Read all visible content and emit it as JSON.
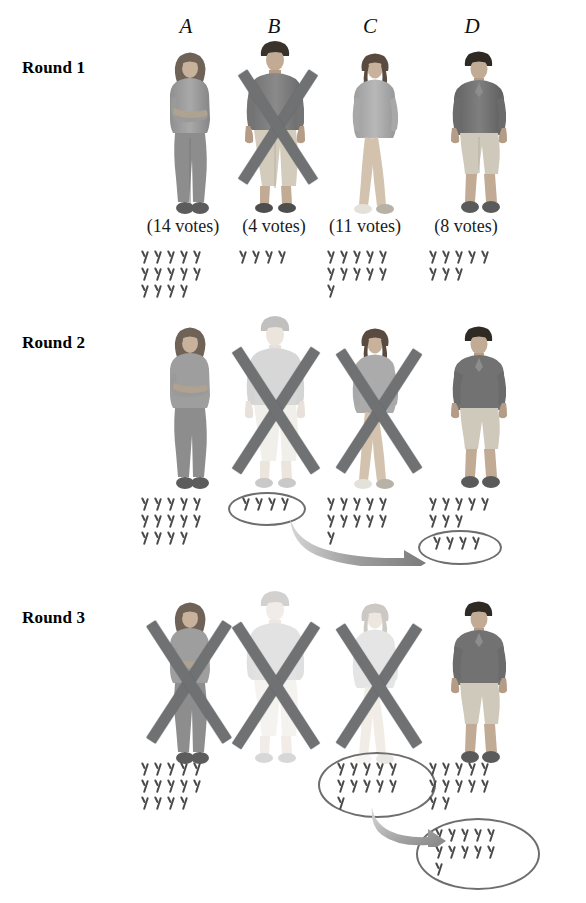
{
  "figure": {
    "columns": [
      {
        "id": "A",
        "label": "A"
      },
      {
        "id": "B",
        "label": "B"
      },
      {
        "id": "C",
        "label": "C"
      },
      {
        "id": "D",
        "label": "D"
      }
    ],
    "colors": {
      "tally_ink": "#4a4a4a",
      "x_mark": "#6f7173",
      "ellipse": "#6e6e6e",
      "arrow": "#8f9193",
      "text": "#111111",
      "background": "#ffffff"
    }
  },
  "rounds": [
    {
      "label": "Round 1",
      "candidates": [
        {
          "id": "A",
          "votes_caption": "(14 votes)",
          "votes": 14,
          "eliminated": false,
          "faded": false,
          "tally_rows": [
            5,
            5,
            4
          ],
          "circled_tally_rows": [],
          "circled_votes": 0
        },
        {
          "id": "B",
          "votes_caption": "(4 votes)",
          "votes": 4,
          "eliminated": true,
          "faded": false,
          "tally_rows": [
            4
          ],
          "circled_tally_rows": [],
          "circled_votes": 0
        },
        {
          "id": "C",
          "votes_caption": "(11 votes)",
          "votes": 11,
          "eliminated": false,
          "faded": false,
          "tally_rows": [
            5,
            5,
            1
          ],
          "circled_tally_rows": [],
          "circled_votes": 0
        },
        {
          "id": "D",
          "votes_caption": "(8 votes)",
          "votes": 8,
          "eliminated": false,
          "faded": false,
          "tally_rows": [
            5,
            3
          ],
          "circled_tally_rows": [],
          "circled_votes": 0
        }
      ]
    },
    {
      "label": "Round 2",
      "candidates": [
        {
          "id": "A",
          "votes_caption": "",
          "votes": 14,
          "eliminated": false,
          "faded": false,
          "tally_rows": [
            5,
            5,
            4
          ],
          "circled_tally_rows": [],
          "circled_votes": 0
        },
        {
          "id": "B",
          "votes_caption": "",
          "votes": 4,
          "eliminated": true,
          "faded": true,
          "tally_rows": [],
          "circled_tally_rows": [
            4
          ],
          "circled_votes": 4
        },
        {
          "id": "C",
          "votes_caption": "",
          "votes": 11,
          "eliminated": true,
          "faded": false,
          "tally_rows": [
            5,
            5,
            1
          ],
          "circled_tally_rows": [],
          "circled_votes": 0
        },
        {
          "id": "D",
          "votes_caption": "",
          "votes": 8,
          "eliminated": false,
          "faded": false,
          "tally_rows": [
            5,
            3
          ],
          "circled_tally_rows": [
            4
          ],
          "circled_votes": 4
        }
      ],
      "transfer": {
        "from": "B",
        "to": "D",
        "amount": 4
      }
    },
    {
      "label": "Round 3",
      "candidates": [
        {
          "id": "A",
          "votes_caption": "",
          "votes": 14,
          "eliminated": true,
          "faded": false,
          "tally_rows": [
            5,
            5,
            4
          ],
          "circled_tally_rows": [],
          "circled_votes": 0
        },
        {
          "id": "B",
          "votes_caption": "",
          "votes": 0,
          "eliminated": true,
          "faded": true,
          "tally_rows": [],
          "circled_tally_rows": [],
          "circled_votes": 0
        },
        {
          "id": "C",
          "votes_caption": "",
          "votes": 11,
          "eliminated": true,
          "faded": true,
          "tally_rows": [],
          "circled_tally_rows": [
            5,
            5,
            1
          ],
          "circled_votes": 11
        },
        {
          "id": "D",
          "votes_caption": "",
          "votes": 12,
          "eliminated": false,
          "faded": false,
          "tally_rows": [
            5,
            5,
            2
          ],
          "circled_tally_rows": [
            5,
            5,
            1
          ],
          "circled_votes": 11
        }
      ],
      "transfer": {
        "from": "C",
        "to": "D",
        "amount": 11
      }
    }
  ],
  "chart_data": {
    "type": "table",
    "categories": [
      "A",
      "B",
      "C",
      "D"
    ],
    "series": [
      {
        "name": "Round 1",
        "values": [
          14,
          4,
          11,
          8
        ]
      },
      {
        "name": "Round 2",
        "values": [
          14,
          0,
          11,
          12
        ]
      },
      {
        "name": "Round 3",
        "values": [
          0,
          0,
          0,
          23
        ]
      }
    ],
    "annotations": [
      "Round 1: B eliminated with 4 votes",
      "Round 2: B's 4 votes transfer to D; C eliminated with 11 votes",
      "Round 3: C's 11 votes transfer to D; A eliminated; D wins"
    ],
    "xlabel": "Candidate",
    "ylabel": "Votes",
    "grid": false,
    "legend": "none"
  }
}
